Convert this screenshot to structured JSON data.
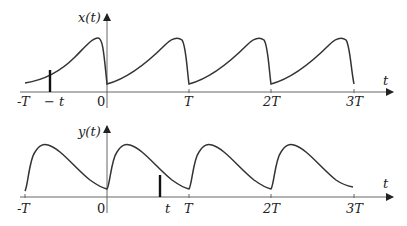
{
  "top_plot": {
    "ylabel": "x(t)",
    "xlabel": "t",
    "ticks": [
      "-T",
      "− t",
      "0",
      "T",
      "2T",
      "3T"
    ]
  },
  "bottom_plot": {
    "ylabel": "y(t)",
    "xlabel": "t",
    "ticks": [
      "-T",
      "0",
      "t",
      "T",
      "2T",
      "3T"
    ]
  }
}
